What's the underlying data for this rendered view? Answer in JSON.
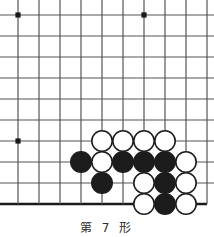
{
  "figure": {
    "kind": "go-board-diagram",
    "caption": "第 7 形",
    "board": {
      "cell_size": 21,
      "origin_x": 18,
      "origin_y": 15,
      "cols": 10,
      "rows": 10,
      "line_color": "#555555",
      "edge_color": "#1a1a1a",
      "edge_width": 2.6,
      "line_width": 1.2,
      "background": "#ffffff",
      "visible_edges": [
        "bottom"
      ],
      "star_points": [
        {
          "col": 0,
          "row": 0
        },
        {
          "col": 6,
          "row": 0
        },
        {
          "col": 0,
          "row": 6
        }
      ],
      "star_radius": 2.6,
      "star_color": "#1a1a1a"
    },
    "stones": {
      "radius": 10.2,
      "black_fill": "#1c1c1c",
      "white_fill": "#ffffff",
      "outline_color": "#1c1c1c",
      "outline_width": 1.6,
      "list": [
        {
          "col": 4,
          "row": 6,
          "color": "white"
        },
        {
          "col": 5,
          "row": 6,
          "color": "white"
        },
        {
          "col": 6,
          "row": 6,
          "color": "white"
        },
        {
          "col": 7,
          "row": 6,
          "color": "white"
        },
        {
          "col": 3,
          "row": 7,
          "color": "black"
        },
        {
          "col": 4,
          "row": 7,
          "color": "white"
        },
        {
          "col": 5,
          "row": 7,
          "color": "black"
        },
        {
          "col": 6,
          "row": 7,
          "color": "black"
        },
        {
          "col": 7,
          "row": 7,
          "color": "black"
        },
        {
          "col": 8,
          "row": 7,
          "color": "white"
        },
        {
          "col": 4,
          "row": 8,
          "color": "black"
        },
        {
          "col": 6,
          "row": 8,
          "color": "white"
        },
        {
          "col": 7,
          "row": 8,
          "color": "black"
        },
        {
          "col": 8,
          "row": 8,
          "color": "white"
        },
        {
          "col": 6,
          "row": 9,
          "color": "white"
        },
        {
          "col": 7,
          "row": 9,
          "color": "black"
        },
        {
          "col": 8,
          "row": 9,
          "color": "white"
        }
      ]
    }
  }
}
